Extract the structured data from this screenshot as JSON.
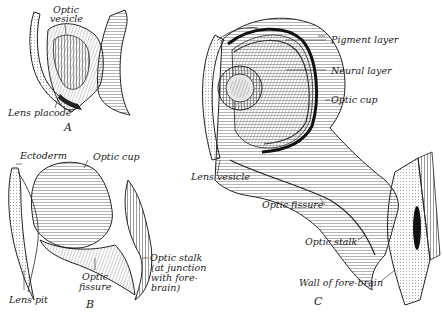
{
  "figures": {
    "A": {
      "caption": "A",
      "labels": {
        "optic_vesicle_1": "Optic",
        "optic_vesicle_2": "vesicle",
        "lens_placode": "Lens placode"
      }
    },
    "B": {
      "caption": "B",
      "labels": {
        "ectoderm": "Ectoderm",
        "optic_cup": "Optic cup",
        "lens_pit": "Lens pit",
        "optic_fissure_1": "Optic",
        "optic_fissure_2": "fissure",
        "optic_stalk_1": "Optic stalk",
        "optic_stalk_2": "(at junction",
        "optic_stalk_3": "with fore-",
        "optic_stalk_4": "brain)"
      }
    },
    "C": {
      "caption": "C",
      "labels": {
        "pigment_layer": "Pigment layer",
        "neural_layer": "Neural layer",
        "optic_cup": "Optic cup",
        "lens_vesicle": "Lens vesicle",
        "optic_fissure": "Optic fissure",
        "optic_stalk": "Optic stalk",
        "wall_of_forebrain": "Wall of fore-brain"
      }
    }
  },
  "colors": {
    "ink": "#1a1a1a",
    "paper": "#ffffff",
    "shade": "#bdbdbd"
  }
}
